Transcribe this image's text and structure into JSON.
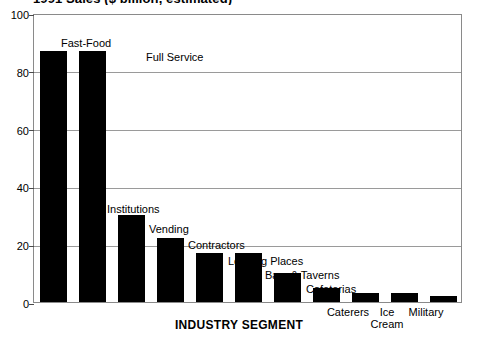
{
  "chart_data": {
    "type": "bar",
    "title": "1991 Sales ($ billion, estimated)",
    "xlabel": "INDUSTRY SEGMENT",
    "ylabel": "",
    "ylim": [
      0,
      100
    ],
    "yticks": [
      0,
      20,
      40,
      60,
      80,
      100
    ],
    "grid": true,
    "legend": "none",
    "bar_color": "#000000",
    "categories": [
      "Fast-Food",
      "Full Service",
      "Institutions",
      "Vending",
      "Contractors",
      "Lodging Places",
      "Bars & Taverns",
      "Cafeterias",
      "Caterers",
      "Ice Cream",
      "Military"
    ],
    "values": [
      87,
      87,
      30,
      22,
      17,
      17,
      10,
      5,
      3,
      3,
      2
    ],
    "annotations": [
      {
        "label": "Fast-Food",
        "placement": "above-left"
      },
      {
        "label": "Full Service",
        "placement": "right"
      },
      {
        "label": "Institutions",
        "placement": "above"
      },
      {
        "label": "Vending",
        "placement": "above-right"
      },
      {
        "label": "Contractors",
        "placement": "above-right"
      },
      {
        "label": "Lodging Places",
        "placement": "above-right"
      },
      {
        "label": "Bars & Taverns",
        "placement": "above-right"
      },
      {
        "label": "Cafeterias",
        "placement": "above-right"
      },
      {
        "label": "Caterers",
        "placement": "below"
      },
      {
        "label": "Ice\nCream",
        "placement": "below"
      },
      {
        "label": "Military",
        "placement": "below"
      }
    ]
  },
  "axis": {
    "y_tick_labels": [
      "0",
      "20",
      "40",
      "60",
      "80",
      "100"
    ],
    "x_title": "INDUSTRY SEGMENT"
  },
  "labels": {
    "fast_food": "Fast-Food",
    "full_service": "Full Service",
    "institutions": "Institutions",
    "vending": "Vending",
    "contractors": "Contractors",
    "lodging_places": "Lodging Places",
    "bars_taverns": "Bars & Taverns",
    "cafeterias": "Cafeterias",
    "caterers": "Caterers",
    "ice_cream_line1": "Ice",
    "ice_cream_line2": "Cream",
    "military": "Military"
  },
  "title_clipped": "1991 Sales ($ billion, estimated)"
}
